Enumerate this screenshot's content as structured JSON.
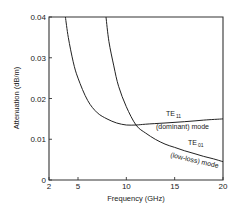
{
  "chart_data": {
    "type": "line",
    "title": "",
    "xlabel": "Frequency (GHz)",
    "ylabel": "Attenuation (dB/m)",
    "xlim": [
      2,
      20
    ],
    "ylim": [
      0,
      0.04
    ],
    "x_ticks": [
      "2",
      "5",
      "10",
      "15",
      "20"
    ],
    "y_ticks": [
      "0",
      "0.01",
      "0.02",
      "0.03",
      "0.04"
    ],
    "grid": false,
    "series": [
      {
        "name": "TE11 (dominant) mode",
        "x": [
          3.7,
          4.0,
          4.5,
          5.0,
          6.0,
          7.0,
          8.0,
          9.0,
          10.0,
          11.0,
          12.0,
          14.0,
          16.0,
          18.0,
          20.0
        ],
        "y": [
          0.04,
          0.035,
          0.029,
          0.025,
          0.0195,
          0.0165,
          0.015,
          0.014,
          0.0135,
          0.0135,
          0.0137,
          0.014,
          0.0143,
          0.0147,
          0.015
        ]
      },
      {
        "name": "TE01 (low-loss) mode",
        "x": [
          7.9,
          8.2,
          8.7,
          9.2,
          10.0,
          11.0,
          12.0,
          13.0,
          14.0,
          15.0,
          16.0,
          17.0,
          18.0,
          19.0,
          20.0
        ],
        "y": [
          0.04,
          0.034,
          0.028,
          0.023,
          0.018,
          0.0135,
          0.0115,
          0.01,
          0.0088,
          0.008,
          0.0072,
          0.0065,
          0.0058,
          0.0052,
          0.0045
        ]
      }
    ],
    "annotations": [
      {
        "text": "TE",
        "sub": "11",
        "line2": "(dominant) mode"
      },
      {
        "text": "TE",
        "sub": "01",
        "line2": "(low-loss) mode"
      }
    ]
  }
}
